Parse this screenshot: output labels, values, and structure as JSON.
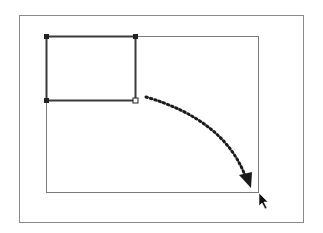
{
  "diagram": {
    "elements": {
      "outer_frame": "canvas-border",
      "inner_frame": "target-area-outline",
      "selected_rect": "selected-rectangle-with-handles",
      "drag_path": "dotted-curved-arrow",
      "cursor": "mouse-pointer-icon"
    },
    "colors": {
      "outer_frame": "#8a8a8a",
      "inner_frame": "#7a7a7a",
      "selected_rect": "#3a3a3a",
      "drag_path": "#1a1a1a",
      "cursor": "#111111"
    }
  }
}
